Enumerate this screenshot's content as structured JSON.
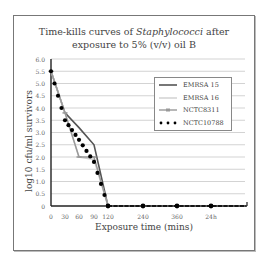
{
  "chart_data": {
    "type": "line",
    "title": "Time-kills curves of Staphylococci after exposure to 5% (v/v) oil B",
    "title_line1_prefix": "Time-kills curves of ",
    "title_line1_italic": "Staphylococci",
    "title_line1_suffix": " after",
    "title_line2": "exposure to 5% (v/v) oil B",
    "xlabel": "Exposure time (mins)",
    "ylabel": "log10 cfu/ml survivors",
    "x": [
      "0",
      "30",
      "60",
      "90",
      "120",
      "240",
      "360",
      "24h"
    ],
    "y_ticks": [
      "0",
      "0.5",
      "1.0",
      "1.5",
      "2.0",
      "2.5",
      "3.0",
      "3.5",
      "4.0",
      "4.5",
      "5.0",
      "5.5",
      "6.0"
    ],
    "ylim": [
      0,
      6.0
    ],
    "grid": true,
    "legend_position": "upper right",
    "series": [
      {
        "name": "EMRSA 15",
        "style": "solid dark line",
        "color": "#555555",
        "values": [
          5.5,
          3.8,
          3.2,
          2.5,
          0,
          0,
          0,
          0
        ]
      },
      {
        "name": "EMRSA 16",
        "style": "solid light line",
        "color": "#c8c8c8",
        "values": [
          5.5,
          3.8,
          2.0,
          1.9,
          0,
          0,
          0,
          0
        ]
      },
      {
        "name": "NCTC8311",
        "style": "line with small markers",
        "color": "#999999",
        "values": [
          5.5,
          3.8,
          2.0,
          2.0,
          0,
          0,
          0,
          0
        ]
      },
      {
        "name": "NCTC10788",
        "style": "dotted (large dots)",
        "color": "#000000",
        "values": [
          5.5,
          3.5,
          2.7,
          1.8,
          0,
          0,
          0,
          0
        ]
      }
    ]
  }
}
